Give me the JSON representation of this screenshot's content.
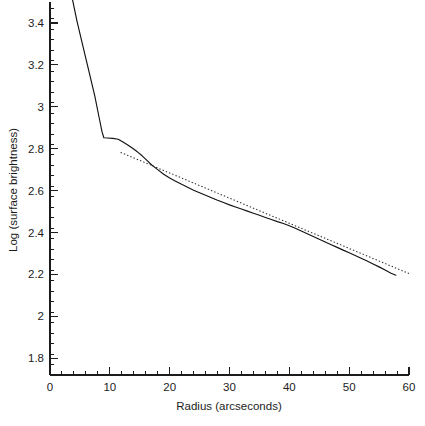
{
  "chart_data": {
    "type": "line",
    "title": "",
    "xlabel": "Radius (arcseconds)",
    "ylabel": "Log (surface brightness)",
    "xlim": [
      0,
      60
    ],
    "ylim": [
      1.72,
      3.5
    ],
    "grid": false,
    "legend": "none",
    "x_ticks_major": [
      0,
      10,
      20,
      30,
      40,
      50,
      60
    ],
    "x_tick_labels": [
      "0",
      "10",
      "20",
      "30",
      "40",
      "50",
      "60"
    ],
    "x_tick_minor_step": 2,
    "y_ticks_major": [
      1.8,
      2.0,
      2.2,
      2.4,
      2.6,
      2.8,
      3.0,
      3.2,
      3.4
    ],
    "y_tick_labels": [
      "1.8",
      "2",
      "2.2",
      "2.4",
      "2.6",
      "2.8",
      "3",
      "3.2",
      "3.4"
    ],
    "y_tick_minor_step": 0.05,
    "series": [
      {
        "name": "observed-profile",
        "style": "solid",
        "color": "#121212",
        "x": [
          3.7,
          4.5,
          5.5,
          6.5,
          7.5,
          8.2,
          8.7,
          9.0,
          9.6,
          10.5,
          11.4,
          12.2,
          13.0,
          13.8,
          14.6,
          15.4,
          16.2,
          17.0,
          18.0,
          19.0,
          20.0,
          21.0,
          22.0,
          23.0,
          24.0,
          25.0,
          26.0,
          27.0,
          28.0,
          29.0,
          30.0,
          31.0,
          32.0,
          33.0,
          34.0,
          35.0,
          36.0,
          37.0,
          38.0,
          39.0,
          40.0,
          41.0,
          42.0,
          43.0,
          44.0,
          45.0,
          46.0,
          47.0,
          48.0,
          49.0,
          50.0,
          51.0,
          52.0,
          53.0,
          54.0,
          55.0,
          56.0,
          57.0,
          57.8
        ],
        "y": [
          3.52,
          3.41,
          3.29,
          3.17,
          3.05,
          2.95,
          2.88,
          2.852,
          2.851,
          2.849,
          2.845,
          2.832,
          2.818,
          2.802,
          2.785,
          2.766,
          2.744,
          2.722,
          2.7,
          2.678,
          2.66,
          2.645,
          2.63,
          2.616,
          2.602,
          2.59,
          2.578,
          2.566,
          2.554,
          2.543,
          2.532,
          2.522,
          2.512,
          2.502,
          2.492,
          2.482,
          2.472,
          2.462,
          2.452,
          2.443,
          2.432,
          2.42,
          2.407,
          2.394,
          2.381,
          2.368,
          2.355,
          2.342,
          2.329,
          2.316,
          2.303,
          2.29,
          2.277,
          2.264,
          2.25,
          2.236,
          2.221,
          2.206,
          2.196
        ]
      },
      {
        "name": "exponential-disk-fit",
        "style": "dotted",
        "color": "#2b2b2b",
        "x": [
          11.8,
          14,
          16,
          18,
          20,
          22,
          24,
          26,
          28,
          30,
          32,
          34,
          36,
          38,
          40,
          42,
          44,
          46,
          48,
          50,
          52,
          54,
          56,
          58,
          60
        ],
        "y": [
          2.782,
          2.756,
          2.732,
          2.708,
          2.684,
          2.66,
          2.636,
          2.612,
          2.588,
          2.564,
          2.54,
          2.516,
          2.492,
          2.468,
          2.444,
          2.42,
          2.396,
          2.372,
          2.348,
          2.324,
          2.3,
          2.276,
          2.252,
          2.228,
          2.204
        ]
      }
    ]
  },
  "axes": {
    "x_title": "Radius (arcseconds)",
    "y_title": "Log (surface brightness)"
  },
  "x_tick_labels": [
    "0",
    "10",
    "20",
    "30",
    "40",
    "50",
    "60"
  ],
  "y_tick_labels": [
    "1.8",
    "2",
    "2.2",
    "2.4",
    "2.6",
    "2.8",
    "3",
    "3.2",
    "3.4"
  ]
}
